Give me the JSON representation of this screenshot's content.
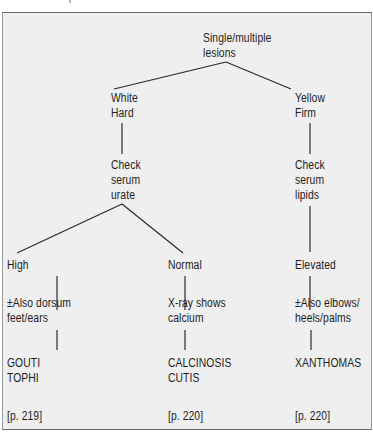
{
  "diagram": {
    "type": "decision-tree",
    "root": {
      "lines": [
        "Single/multiple",
        "lesions"
      ]
    },
    "branches": [
      {
        "appearance": [
          "White",
          "Hard"
        ],
        "test": [
          "Check",
          "serum",
          "urate"
        ],
        "outcomes": [
          {
            "result": "High",
            "note": [
              "±Also dorsum",
              "feet/ears"
            ],
            "diagnosis": [
              "GOUTI",
              "TOPHI"
            ],
            "page_ref": "[p. 219]"
          },
          {
            "result": "Normal",
            "note": [
              "X-ray shows",
              "calcium"
            ],
            "diagnosis": [
              "CALCINOSIS",
              "CUTIS"
            ],
            "page_ref": "[p. 220]"
          }
        ]
      },
      {
        "appearance": [
          "Yellow",
          "Firm"
        ],
        "test": [
          "Check",
          "serum",
          "lipids"
        ],
        "outcomes": [
          {
            "result": "Elevated",
            "note": [
              "±Also elbows/",
              "heels/palms"
            ],
            "diagnosis": [
              "XANTHOMAS"
            ],
            "page_ref": "[p. 220]"
          }
        ]
      }
    ]
  },
  "colors": {
    "background": "#efefef",
    "text": "#1d1d1d",
    "line": "#2a2a2a"
  }
}
